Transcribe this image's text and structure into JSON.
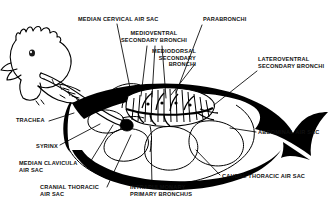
{
  "figure": {
    "style": "black-and-white line drawing with solid black fill",
    "background_color": "#ffffff",
    "ink_color": "#000000",
    "label_color": "#111111"
  },
  "labels": [
    {
      "id": "median-cervical-air-sac",
      "lines": [
        "MEDIAN CERVICAL AIR SAC"
      ],
      "text": "MEDIAN CERVICAL AIR SAC",
      "align": "left",
      "x": 78,
      "y": 16,
      "leader": [
        [
          117,
          24
        ],
        [
          130,
          88
        ]
      ]
    },
    {
      "id": "medioventral-secondary-bronchi",
      "lines": [
        "MEDIOVENTRAL",
        "SECONDARY BRONCHI"
      ],
      "text": "MEDIOVENTRAL SECONDARY BRONCHI",
      "align": "center",
      "x": 117,
      "y": 30,
      "width": 74,
      "leader": [
        [
          149,
          46
        ],
        [
          143,
          95
        ]
      ]
    },
    {
      "id": "parabronchi",
      "lines": [
        "PARABRONCHI"
      ],
      "text": "PARABRONCHI",
      "align": "left",
      "x": 203,
      "y": 16,
      "leader": [
        [
          202,
          24
        ],
        [
          175,
          92
        ]
      ]
    },
    {
      "id": "mediodorsal-secondary-bronchi",
      "lines": [
        "MEDIODORSAL",
        "SECONDARY",
        "BRONCHI"
      ],
      "text": "MEDIODORSAL SECONDARY BRONCHI",
      "align": "right",
      "x": 196,
      "y": 48,
      "width": 55,
      "leader": [
        [
          196,
          62
        ],
        [
          168,
          96
        ]
      ]
    },
    {
      "id": "lateroventral-secondary-bronchi",
      "lines": [
        "LATEROVENTRAL",
        "SECONDARY BRONCHI"
      ],
      "text": "LATEROVENTRAL SECONDARY BRONCHI",
      "align": "left",
      "x": 258,
      "y": 56,
      "width": 74,
      "leader": [
        [
          258,
          70
        ],
        [
          196,
          108
        ]
      ]
    },
    {
      "id": "trachea",
      "lines": [
        "TRACHEA"
      ],
      "text": "TRACHEA",
      "align": "left",
      "x": 16,
      "y": 119,
      "leader": [
        [
          48,
          122
        ],
        [
          72,
          114
        ]
      ]
    },
    {
      "id": "abdominal-air-sac",
      "lines": [
        "ABDOMINAL AIR SAC"
      ],
      "text": "ABDOMINAL AIR SAC",
      "align": "left",
      "x": 258,
      "y": 130,
      "leader": [
        [
          256,
          133
        ],
        [
          232,
          128
        ]
      ]
    },
    {
      "id": "syrinx",
      "lines": [
        "SYRINX"
      ],
      "text": "SYRINX",
      "align": "left",
      "x": 36,
      "y": 146,
      "leader": [
        [
          60,
          146
        ],
        [
          96,
          122
        ]
      ]
    },
    {
      "id": "median-clavicula-air-sac",
      "lines": [
        "MEDIAN CLAVICULA",
        "AIR SAC"
      ],
      "text": "MEDIAN CLAVICULA AIR SAC",
      "align": "left",
      "x": 19,
      "y": 163,
      "leader": [
        [
          90,
          165
        ],
        [
          118,
          120
        ]
      ]
    },
    {
      "id": "caudal-thoracic-air-sac",
      "lines": [
        "CAUDAL THORACIC AIR SAC"
      ],
      "text": "CAUDAL THORACIC AIR SAC",
      "align": "left",
      "x": 222,
      "y": 176,
      "leader": [
        [
          220,
          176
        ],
        [
          198,
          148
        ]
      ]
    },
    {
      "id": "cranial-thoracic-air-sac",
      "lines": [
        "CRANIAL THORACIC",
        "AIR SAC"
      ],
      "text": "CRANIAL THORACIC AIR SAC",
      "align": "left",
      "x": 40,
      "y": 187,
      "leader": [
        [
          108,
          188
        ],
        [
          133,
          134
        ]
      ]
    },
    {
      "id": "intrapulmonary-primary-bronchus",
      "lines": [
        "INTRAPULMONARY",
        "PRIMARY BRONCHUS"
      ],
      "text": "INTRAPULMONARY PRIMARY BRONCHUS",
      "align": "left",
      "x": 130,
      "y": 187,
      "leader": [
        [
          152,
          186
        ],
        [
          152,
          140
        ]
      ]
    }
  ]
}
